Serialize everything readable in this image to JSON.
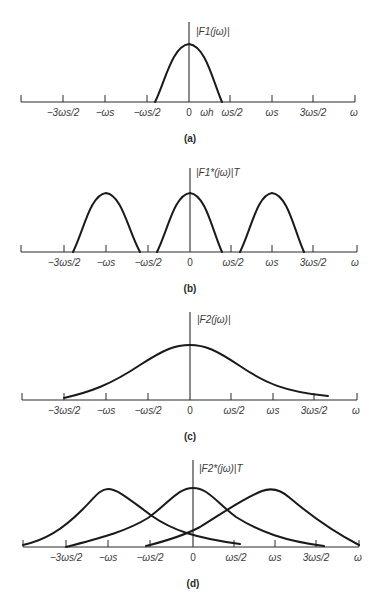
{
  "figure": {
    "panels": [
      {
        "id": "a",
        "caption": "(a)",
        "ylabel": "|F1(jω)|",
        "tick_labels": [
          "−3ωs/2",
          "−ωs",
          "−ωs/2",
          "0",
          "ωh",
          "ωs/2",
          "ωs",
          "3ωs/2",
          "ω"
        ]
      },
      {
        "id": "b",
        "caption": "(b)",
        "ylabel": "|F1*(jω)|T",
        "tick_labels": [
          "−3ωs/2",
          "−ωs",
          "−ωs/2",
          "0",
          "ωs/2",
          "ωs",
          "3ωs/2",
          "ω"
        ]
      },
      {
        "id": "c",
        "caption": "(c)",
        "ylabel": "|F2(jω)|",
        "tick_labels": [
          "−3ωs/2",
          "−ωs",
          "−ωs/2",
          "0",
          "ωs/2",
          "ωs",
          "3ωs/2",
          "ω"
        ]
      },
      {
        "id": "d",
        "caption": "(d)",
        "ylabel": "|F2*(jω)|T",
        "tick_labels": [
          "−3ωs/2",
          "−ωs",
          "−ωs/2",
          "0",
          "ωs/2",
          "ωs",
          "3ωs/2",
          "ω"
        ]
      }
    ]
  }
}
